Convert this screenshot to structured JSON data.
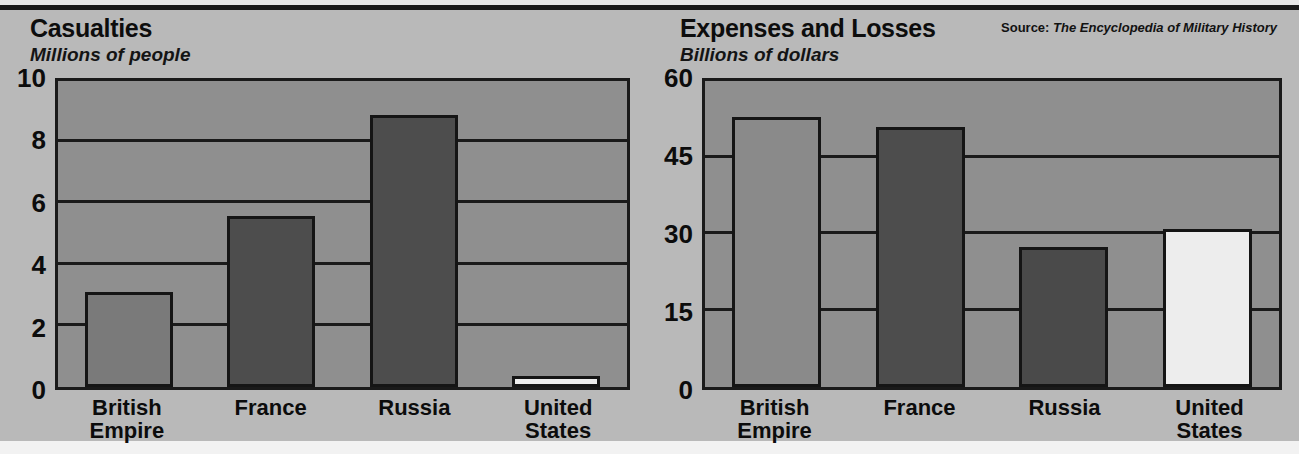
{
  "page": {
    "background_color": "#b9b9b9",
    "source_label": "Source:",
    "source_name": "The Encyclopedia of Military History"
  },
  "chart_data": [
    {
      "type": "bar",
      "title": "Casualties",
      "subtitle": "Millions of people",
      "xlabel": "",
      "ylabel": "Millions of people",
      "categories": [
        "British\nEmpire",
        "France",
        "Russia",
        "United\nStates"
      ],
      "values": [
        3.1,
        5.6,
        8.9,
        0.35
      ],
      "bar_colors": [
        "#7a7a7a",
        "#4d4d4d",
        "#4d4d4d",
        "#ededed"
      ],
      "ylim": [
        0,
        10
      ],
      "yticks": [
        0,
        2,
        4,
        6,
        8,
        10
      ],
      "ytick_labels": [
        "0",
        "2",
        "4",
        "6",
        "8",
        "10"
      ],
      "grid": true,
      "legend": "none",
      "plot_background": "#8f8f8f"
    },
    {
      "type": "bar",
      "title": "Expenses and Losses",
      "subtitle": "Billions of dollars",
      "xlabel": "",
      "ylabel": "Billions of dollars",
      "categories": [
        "British\nEmpire",
        "France",
        "Russia",
        "United\nStates"
      ],
      "values": [
        53,
        51,
        27.5,
        31
      ],
      "bar_colors": [
        "#8a8a8a",
        "#4d4d4d",
        "#4a4a4a",
        "#ededed"
      ],
      "ylim": [
        0,
        60
      ],
      "yticks": [
        0,
        15,
        30,
        45,
        60
      ],
      "ytick_labels": [
        "0",
        "15",
        "30",
        "45",
        "60"
      ],
      "grid": true,
      "legend": "none",
      "plot_background": "#8f8f8f"
    }
  ]
}
